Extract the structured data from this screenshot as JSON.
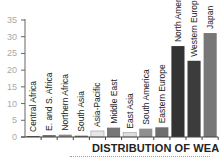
{
  "chart_data": {
    "type": "bar",
    "title": "DISTRIBUTION OF WEALTH",
    "xlabel": "",
    "ylabel": "",
    "ylim": [
      0,
      35
    ],
    "yticks": [
      0,
      5,
      10,
      15,
      20,
      25,
      30,
      35
    ],
    "grid": false,
    "legend": null,
    "categories": [
      "Central Africa",
      "E. and S. Africa",
      "Northern Africa",
      "South Asia",
      "Asia-Pacific",
      "Middle East",
      "East Asia",
      "South America",
      "Eastern Europe",
      "North America",
      "Western Europe",
      "Japan"
    ],
    "values": [
      0.3,
      0.6,
      0.7,
      0.4,
      1.8,
      2.8,
      1.3,
      2.5,
      2.9,
      27.2,
      22.8,
      31.1
    ],
    "colors": [
      "#555555",
      "#777777",
      "#8a8a8a",
      "#666666",
      "#e6e6e6",
      "#777777",
      "#dddddd",
      "#909090",
      "#6e6e6e",
      "#333333",
      "#3c3c3c",
      "#777777"
    ]
  }
}
